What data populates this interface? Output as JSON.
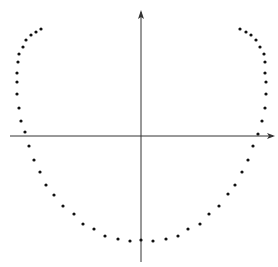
{
  "chart_data": {
    "type": "scatter",
    "title": "",
    "xlabel": "",
    "ylabel": "",
    "grid": false,
    "axes": {
      "x_axis": {
        "y_px": 136,
        "x_start_px": 10,
        "x_end_px": 275,
        "arrow": "right"
      },
      "y_axis": {
        "x_px": 141,
        "y_start_px": 262,
        "y_end_px": 10,
        "arrow": "up"
      }
    },
    "point_color": "#111111",
    "axis_color": "#333333",
    "points_px": [
      [
        41,
        29
      ],
      [
        36,
        32
      ],
      [
        31,
        35
      ],
      [
        26,
        40
      ],
      [
        23,
        47
      ],
      [
        19,
        54
      ],
      [
        18,
        62
      ],
      [
        17,
        73
      ],
      [
        17,
        82
      ],
      [
        17,
        94
      ],
      [
        19,
        108
      ],
      [
        21,
        121
      ],
      [
        25,
        132
      ],
      [
        29,
        146
      ],
      [
        34,
        160
      ],
      [
        40,
        172
      ],
      [
        46,
        185
      ],
      [
        54,
        195
      ],
      [
        63,
        206
      ],
      [
        74,
        214
      ],
      [
        83,
        224
      ],
      [
        94,
        229
      ],
      [
        105,
        236
      ],
      [
        118,
        239
      ],
      [
        130,
        241
      ],
      [
        141,
        240
      ],
      [
        153,
        241
      ],
      [
        166,
        239
      ],
      [
        178,
        236
      ],
      [
        188,
        229
      ],
      [
        200,
        224
      ],
      [
        209,
        214
      ],
      [
        219,
        206
      ],
      [
        228,
        194
      ],
      [
        235,
        185
      ],
      [
        242,
        172
      ],
      [
        248,
        160
      ],
      [
        253,
        146
      ],
      [
        258,
        134
      ],
      [
        262,
        121
      ],
      [
        265,
        108
      ],
      [
        266,
        94
      ],
      [
        266,
        82
      ],
      [
        265,
        73
      ],
      [
        265,
        62
      ],
      [
        264,
        54
      ],
      [
        260,
        47
      ],
      [
        256,
        40
      ],
      [
        251,
        35
      ],
      [
        246,
        32
      ],
      [
        240,
        29
      ]
    ]
  }
}
